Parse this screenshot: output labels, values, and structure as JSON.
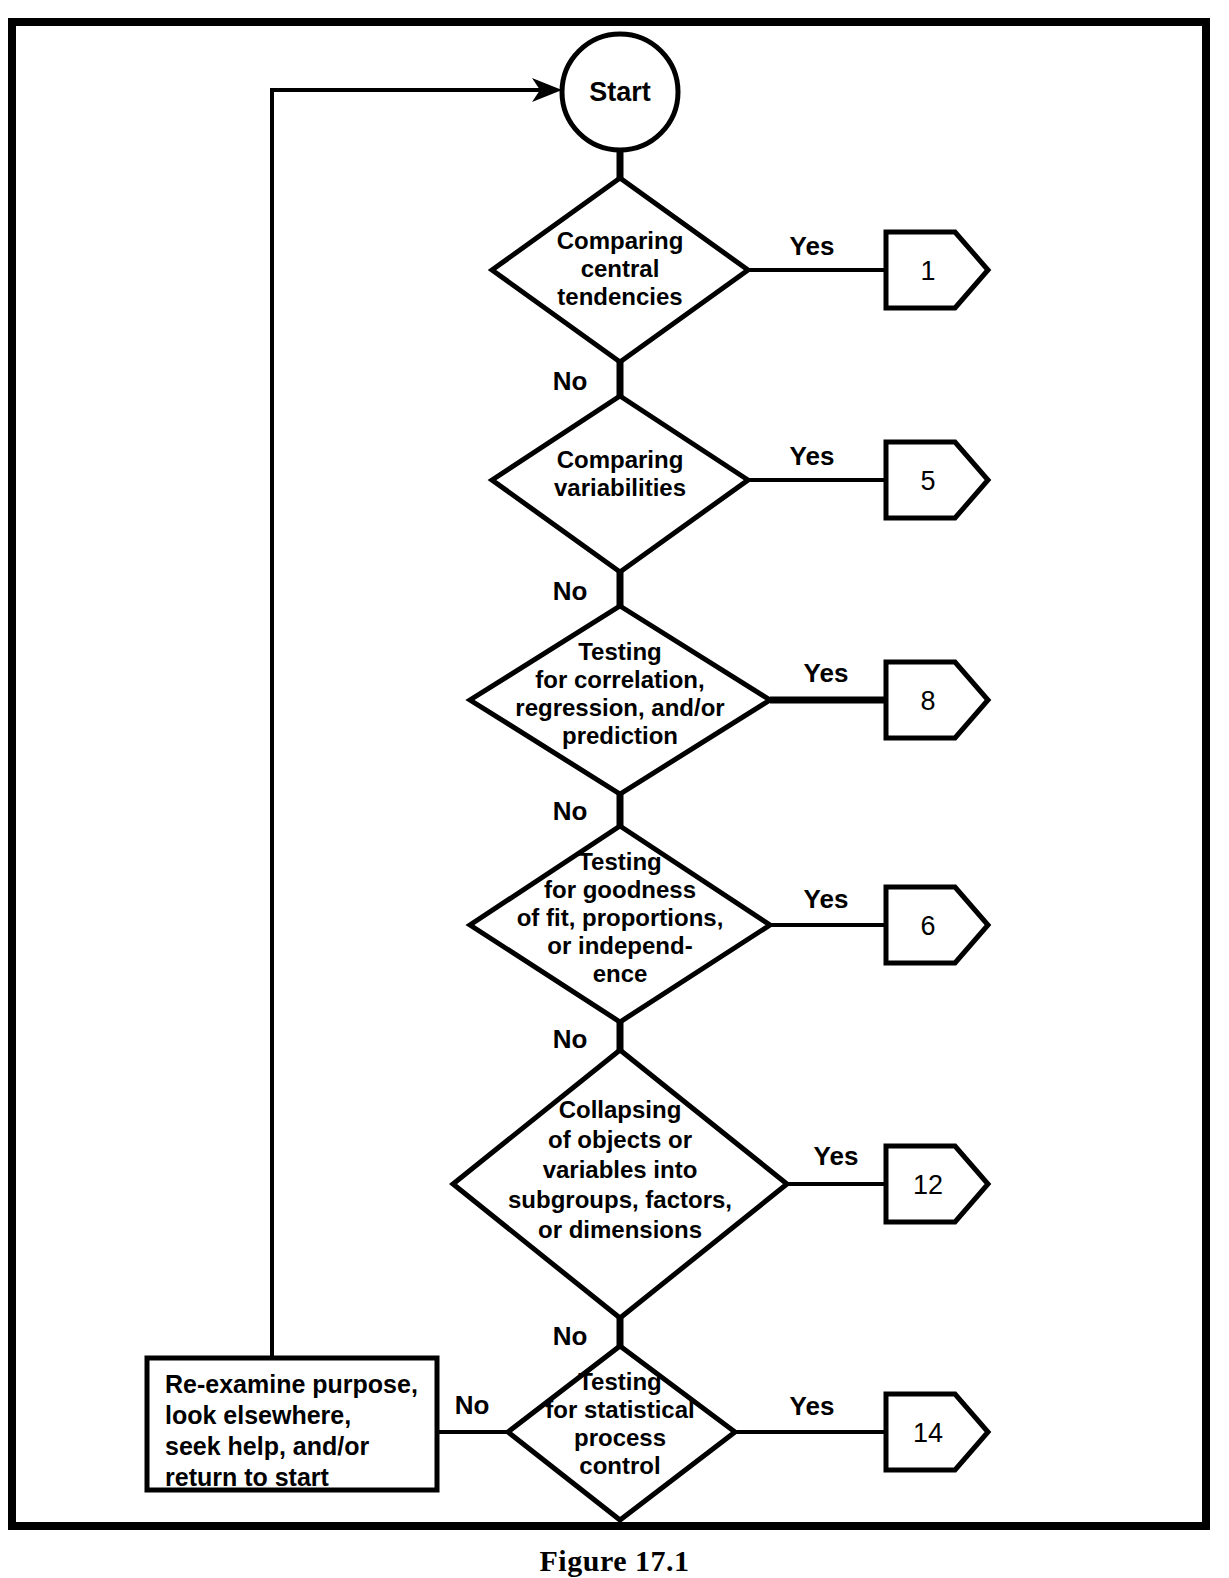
{
  "figure": {
    "caption": "Figure 17.1",
    "border_color": "#000000",
    "background_color": "#ffffff",
    "line_color": "#000000"
  },
  "start_node": {
    "label": "Start",
    "shape": "circle"
  },
  "decisions": [
    {
      "id": "central-tendencies",
      "lines": [
        "Comparing",
        "central",
        "tendencies"
      ],
      "yes_label": "Yes",
      "no_label": "No",
      "yes_target": "1",
      "highlighted": false
    },
    {
      "id": "variabilities",
      "lines": [
        "Comparing",
        "variabilities"
      ],
      "yes_label": "Yes",
      "no_label": "No",
      "yes_target": "5",
      "highlighted": false
    },
    {
      "id": "correlation-regression",
      "lines": [
        "Testing",
        "for correlation,",
        "regression, and/or",
        "prediction"
      ],
      "yes_label": "Yes",
      "no_label": "No",
      "yes_target": "8",
      "highlighted": true
    },
    {
      "id": "goodness-of-fit",
      "lines": [
        "Testing",
        "for goodness",
        "of fit, proportions,",
        "or independ-",
        "ence"
      ],
      "yes_label": "Yes",
      "no_label": "No",
      "yes_target": "6",
      "highlighted": false
    },
    {
      "id": "collapsing",
      "lines": [
        "Collapsing",
        "of objects or",
        "variables into",
        "subgroups, factors,",
        "or dimensions"
      ],
      "yes_label": "Yes",
      "no_label": "No",
      "yes_target": "12",
      "highlighted": false
    },
    {
      "id": "statistical-process-control",
      "lines": [
        "Testing",
        "for statistical",
        "process",
        "control"
      ],
      "yes_label": "Yes",
      "no_label": "No",
      "yes_target": "14",
      "highlighted": false
    }
  ],
  "terminal_box": {
    "lines": [
      "Re-examine purpose,",
      "look elsewhere,",
      "seek help, and/or",
      "return to start"
    ]
  },
  "connectors": {
    "feedback_note": "return path from re-examine box up and right into Start"
  }
}
